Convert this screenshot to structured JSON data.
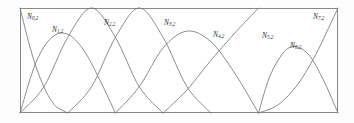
{
  "figure": {
    "name": "quadratic-b-spline-basis-functions",
    "frame": {
      "x": 20,
      "y": 8,
      "width": 318,
      "height": 105
    },
    "colors": {
      "curve": "#6e6e6e",
      "frame": "#8a8a8a",
      "label": "#2b2b2b",
      "background": "#fdfdfd"
    }
  },
  "labels": [
    {
      "base": "N",
      "sub": "0,2",
      "text": "N0,2",
      "x": 27,
      "y": 13
    },
    {
      "base": "N",
      "sub": "1,2",
      "text": "N1,2",
      "x": 52,
      "y": 26
    },
    {
      "base": "N",
      "sub": "2,2",
      "text": "N2,2",
      "x": 104,
      "y": 19
    },
    {
      "base": "N",
      "sub": "3,2",
      "text": "N3,2",
      "x": 164,
      "y": 19
    },
    {
      "base": "N",
      "sub": "4,2",
      "text": "N4,2",
      "x": 213,
      "y": 31
    },
    {
      "base": "N",
      "sub": "5,2",
      "text": "N5,2",
      "x": 262,
      "y": 32
    },
    {
      "base": "N",
      "sub": "6,2",
      "text": "N6,2",
      "x": 290,
      "y": 42
    },
    {
      "base": "N",
      "sub": "7,2",
      "text": "N7,2",
      "x": 313,
      "y": 13
    }
  ],
  "chart_data": {
    "type": "line",
    "title": "",
    "xlabel": "",
    "ylabel": "",
    "xlim": [
      0,
      1
    ],
    "ylim": [
      0,
      1
    ],
    "grid": false,
    "legend": "inline-annotations",
    "degree": 2,
    "knot_vector": [
      0,
      0,
      0,
      0.15,
      0.3,
      0.45,
      0.6,
      0.75,
      0.75,
      0.9,
      1,
      1,
      1
    ],
    "series": [
      {
        "name": "N0,2",
        "peak_x": 0.0,
        "peak_y": 1.0,
        "support": [
          0.0,
          0.15
        ],
        "points": [
          [
            0.0,
            1.0
          ],
          [
            0.0375,
            0.5625
          ],
          [
            0.075,
            0.25
          ],
          [
            0.1125,
            0.0625
          ],
          [
            0.15,
            0.0
          ]
        ]
      },
      {
        "name": "N1,2",
        "peak_x": 0.1,
        "peak_y": 0.75,
        "support": [
          0.0,
          0.3
        ],
        "points": [
          [
            0.0,
            0.0
          ],
          [
            0.05,
            0.48
          ],
          [
            0.1,
            0.72
          ],
          [
            0.15,
            0.75
          ],
          [
            0.2,
            0.6
          ],
          [
            0.25,
            0.32
          ],
          [
            0.3,
            0.0
          ]
        ]
      },
      {
        "name": "N2,2",
        "peak_x": 0.225,
        "peak_y": 1.0,
        "support": [
          0.0,
          0.45
        ],
        "points": [
          [
            0.0,
            0.0
          ],
          [
            0.075,
            0.25
          ],
          [
            0.15,
            0.72
          ],
          [
            0.225,
            1.0
          ],
          [
            0.3,
            0.72
          ],
          [
            0.375,
            0.25
          ],
          [
            0.45,
            0.0
          ]
        ]
      },
      {
        "name": "N3,2",
        "peak_x": 0.375,
        "peak_y": 1.0,
        "support": [
          0.15,
          0.6
        ],
        "points": [
          [
            0.15,
            0.0
          ],
          [
            0.225,
            0.25
          ],
          [
            0.3,
            0.72
          ],
          [
            0.375,
            1.0
          ],
          [
            0.45,
            0.72
          ],
          [
            0.525,
            0.25
          ],
          [
            0.6,
            0.0
          ]
        ]
      },
      {
        "name": "N4,2",
        "peak_x": 0.525,
        "peak_y": 0.78,
        "support": [
          0.3,
          0.75
        ],
        "points": [
          [
            0.3,
            0.0
          ],
          [
            0.375,
            0.25
          ],
          [
            0.45,
            0.62
          ],
          [
            0.525,
            0.78
          ],
          [
            0.6,
            0.68
          ],
          [
            0.675,
            0.38
          ],
          [
            0.75,
            0.0
          ]
        ]
      },
      {
        "name": "N5,2",
        "peak_x": 0.75,
        "peak_y": 1.0,
        "support": [
          0.45,
          0.75
        ],
        "points": [
          [
            0.45,
            0.0
          ],
          [
            0.525,
            0.22
          ],
          [
            0.6,
            0.5
          ],
          [
            0.675,
            0.76
          ],
          [
            0.75,
            1.0
          ]
        ],
        "note": "repeated knot produces sharp apex"
      },
      {
        "name": "N6,2",
        "peak_x": 0.845,
        "peak_y": 0.62,
        "support": [
          0.75,
          1.0
        ],
        "points": [
          [
            0.75,
            0.0
          ],
          [
            0.79,
            0.38
          ],
          [
            0.845,
            0.62
          ],
          [
            0.9,
            0.58
          ],
          [
            0.95,
            0.34
          ],
          [
            1.0,
            0.0
          ]
        ]
      },
      {
        "name": "N7,2",
        "peak_x": 1.0,
        "peak_y": 1.0,
        "support": [
          0.75,
          1.0
        ],
        "points": [
          [
            0.75,
            0.0
          ],
          [
            0.8125,
            0.08
          ],
          [
            0.875,
            0.28
          ],
          [
            0.9375,
            0.6
          ],
          [
            1.0,
            1.0
          ]
        ]
      }
    ]
  }
}
